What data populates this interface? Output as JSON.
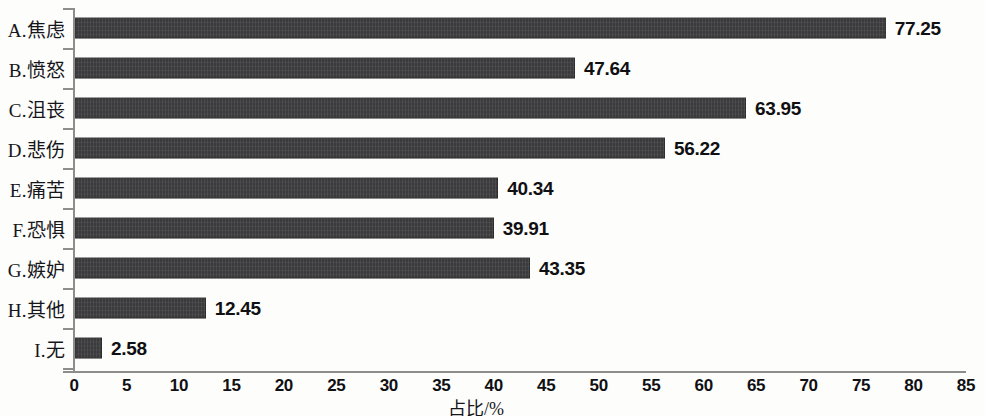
{
  "chart_data": {
    "type": "bar",
    "orientation": "horizontal",
    "title": "",
    "xlabel": "占比/%",
    "ylabel": "",
    "xlim": [
      0,
      85
    ],
    "xticks": [
      "0",
      "5",
      "10",
      "15",
      "20",
      "25",
      "30",
      "35",
      "40",
      "45",
      "50",
      "55",
      "60",
      "65",
      "70",
      "75",
      "80",
      "85"
    ],
    "grid": false,
    "legend": false,
    "bar_color": "#3b3b3d",
    "axis_color": "#8d8d8d",
    "categories": [
      "A.焦虑",
      "B.愤怒",
      "C.沮丧",
      "D.悲伤",
      "E.痛苦",
      "F.恐惧",
      "G.嫉妒",
      "H.其他",
      "I.无"
    ],
    "values": [
      77.25,
      47.64,
      63.95,
      56.22,
      40.34,
      39.91,
      43.35,
      12.45,
      2.58
    ],
    "value_labels": [
      "77.25",
      "47.64",
      "63.95",
      "56.22",
      "40.34",
      "39.91",
      "43.35",
      "12.45",
      "2.58"
    ]
  }
}
